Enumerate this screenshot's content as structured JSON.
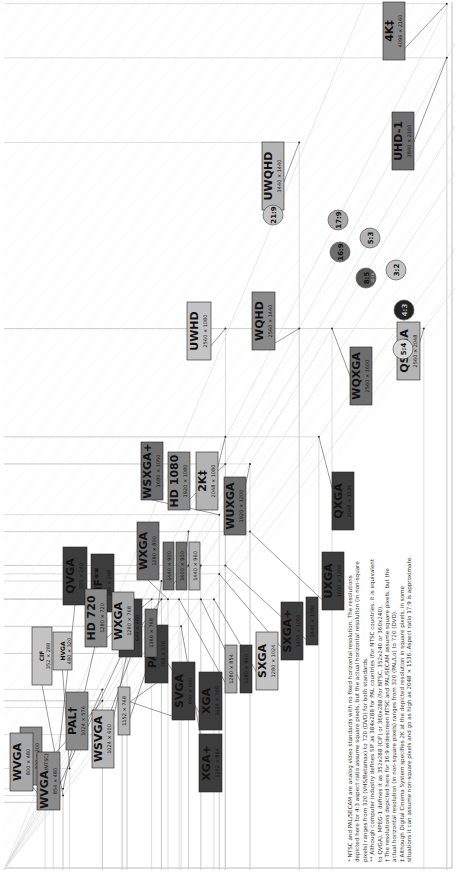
{
  "chart_data": {
    "type": "diagram",
    "axes": {
      "x": "width (px)",
      "y": "height (px)",
      "xmax": 4096,
      "ymax": 2160
    },
    "standards": [
      {
        "name": "CGA",
        "res": "320 × 200",
        "w": 320,
        "h": 200,
        "shade": "#8a8a8a",
        "lx": 20,
        "ly": 25,
        "lw": 22,
        "lh": 58
      },
      {
        "name": "CIF",
        "res": "352 × 288",
        "w": 352,
        "h": 288,
        "shade": "#c4c4c4",
        "lx": 32,
        "ly": 125,
        "lw": 20,
        "lh": 58,
        "small": true
      },
      {
        "name": "HVGA",
        "res": "480 × 320",
        "w": 480,
        "h": 320,
        "shade": "#bdbdbd",
        "lx": 53,
        "ly": 140,
        "lw": 19,
        "lh": 38,
        "small": true
      },
      {
        "name": "QVGA",
        "res": "320 × 240",
        "w": 320,
        "h": 240,
        "shade": "#3c3c3c",
        "lx": 63,
        "ly": 205,
        "lw": 24,
        "lh": 58
      },
      {
        "name": "SIF**",
        "res": "384 × 288",
        "w": 384,
        "h": 288,
        "shade": "#3c3c3c",
        "lx": 91,
        "ly": 198,
        "lw": 23,
        "lh": 58
      },
      {
        "name": "VGA",
        "res": "640 × 480",
        "w": 640,
        "h": 480,
        "shade": "#3c3c3c",
        "lx": 119,
        "ly": 153,
        "lw": 23,
        "lh": 58,
        "sub": "(NTSC)"
      },
      {
        "name": "PAL*",
        "res": "768 × 576",
        "w": 768,
        "h": 576,
        "shade": "#3c3c3c",
        "lx": 145,
        "ly": 127,
        "lw": 23,
        "lh": 58
      },
      {
        "name": "SVGA",
        "res": "800 × 600",
        "w": 800,
        "h": 600,
        "shade": "#3c3c3c",
        "lx": 172,
        "ly": 90,
        "lw": 23,
        "lh": 58
      },
      {
        "name": "XGA",
        "res": "1024 × 768",
        "w": 1024,
        "h": 768,
        "shade": "#3c3c3c",
        "lx": 199,
        "ly": 80,
        "lw": 23,
        "lh": 58
      },
      {
        "name": "XGA+",
        "res": "1152 × 864",
        "w": 1152,
        "h": 864,
        "shade": "#3c3c3c",
        "lx": 199,
        "ly": 18,
        "lw": 23,
        "lh": 58
      },
      {
        "name": "WVGA",
        "res": "800 × 480",
        "w": 800,
        "h": 480,
        "shade": "#a8a8a8",
        "lx": 10,
        "ly": 19,
        "lw": 23,
        "lh": 58
      },
      {
        "name": "WVGA",
        "res": "854 × 480",
        "w": 854,
        "h": 480,
        "shade": "#8a8a8a",
        "lx": 37,
        "ly": 0,
        "lw": 23,
        "lh": 58,
        "sub": "(NTSC)"
      },
      {
        "name": "PAL†",
        "res": "1024 × 576",
        "w": 1024,
        "h": 576,
        "shade": "#8a8a8a",
        "lx": 66,
        "ly": -60,
        "lw": 22,
        "lh": 58
      },
      {
        "name": "WSVGA",
        "res": "1024 × 600",
        "w": 1024,
        "h": 600,
        "shade": "#b4b4b4",
        "lx": 92,
        "ly": -42,
        "lw": 22,
        "lh": 58
      },
      {
        "name": "",
        "res": "1152 × 768",
        "w": 1152,
        "h": 768,
        "shade": "#b4b4b4",
        "lx": 118,
        "ly": -75,
        "lw": 12,
        "lh": 48,
        "small": true
      },
      {
        "name": "HD 720",
        "res": "1280 × 720",
        "w": 1280,
        "h": 720,
        "shade": "#8a8a8a",
        "lx": 85,
        "ly": -163,
        "lw": 22,
        "lh": 58
      },
      {
        "name": "WXGA",
        "res": "1280 × 768",
        "w": 1280,
        "h": 768,
        "shade": "#a8a8a8",
        "lx": 112,
        "ly": -160,
        "lw": 22,
        "lh": 58
      },
      {
        "name": "",
        "res": "1366 × 768",
        "w": 1366,
        "h": 768,
        "shade": "#6e6e6e",
        "lx": 145,
        "ly": -153,
        "lw": 12,
        "lh": 48,
        "small": true
      },
      {
        "name": "WXGA",
        "res": "1280 × 800",
        "w": 1280,
        "h": 800,
        "shade": "#6e6e6e",
        "lx": 137,
        "ly": -230,
        "lw": 22,
        "lh": 58
      },
      {
        "name": "",
        "res": "1440 × 900",
        "w": 1440,
        "h": 900,
        "shade": "#6e6e6e",
        "lx": 163,
        "ly": -220,
        "lw": 11,
        "lh": 48,
        "small": true
      },
      {
        "name": "",
        "res": "1600 × 900",
        "w": 1600,
        "h": 900,
        "shade": "#6e6e6e",
        "lx": 176,
        "ly": -220,
        "lw": 11,
        "lh": 48,
        "small": true
      },
      {
        "name": "",
        "res": "1440 × 960",
        "w": 1440,
        "h": 960,
        "shade": "#b4b4b4",
        "lx": 189,
        "ly": -220,
        "lw": 11,
        "lh": 48,
        "small": true
      },
      {
        "name": "WSXGA+",
        "res": "1680 × 1050",
        "w": 1680,
        "h": 1050,
        "shade": "#6e6e6e",
        "lx": 141,
        "ly": -310,
        "lw": 22,
        "lh": 58
      },
      {
        "name": "HD 1080",
        "res": "1920 × 1080",
        "w": 1920,
        "h": 1080,
        "shade": "#8a8a8a",
        "lx": 168,
        "ly": -300,
        "lw": 22,
        "lh": 58
      },
      {
        "name": "2K‡",
        "res": "2048 × 1080",
        "w": 2048,
        "h": 1080,
        "shade": "#b4b4b4",
        "lx": 196,
        "ly": -300,
        "lw": 22,
        "lh": 58
      },
      {
        "name": "WUXGA",
        "res": "1920 × 1200",
        "w": 1920,
        "h": 1200,
        "shade": "#6e6e6e",
        "lx": 224,
        "ly": -275,
        "lw": 22,
        "lh": 58
      },
      {
        "name": "",
        "res": "1280 × 854",
        "w": 1280,
        "h": 854,
        "shade": "#a8a8a8",
        "lx": 225,
        "ly": -117,
        "lw": 12,
        "lh": 48,
        "small": true
      },
      {
        "name": "",
        "res": "1280 × 960",
        "w": 1280,
        "h": 960,
        "shade": "#3c3c3c",
        "lx": 240,
        "ly": -117,
        "lw": 12,
        "lh": 48,
        "small": true
      },
      {
        "name": "SXGA",
        "res": "1280 × 1024",
        "w": 1280,
        "h": 1024,
        "shade": "#c4c4c4",
        "lx": 256,
        "ly": -120,
        "lw": 22,
        "lh": 58
      },
      {
        "name": "SXGA+",
        "res": "1400 × 1050",
        "w": 1400,
        "h": 1050,
        "shade": "#3c3c3c",
        "lx": 281,
        "ly": -150,
        "lw": 22,
        "lh": 58
      },
      {
        "name": "",
        "res": "1440 × 1080",
        "w": 1440,
        "h": 1080,
        "shade": "#3c3c3c",
        "lx": 306,
        "ly": -165,
        "lw": 12,
        "lh": 48,
        "small": true
      },
      {
        "name": "UXGA",
        "res": "1600 × 1200",
        "w": 1600,
        "h": 1200,
        "shade": "#3c3c3c",
        "lx": 322,
        "ly": -200,
        "lw": 22,
        "lh": 58
      },
      {
        "name": "QXGA",
        "res": "2048 × 1536",
        "w": 2048,
        "h": 1536,
        "shade": "#3c3c3c",
        "lx": 332,
        "ly": -280,
        "lw": 22,
        "lh": 58
      },
      {
        "name": "WQXGA",
        "res": "2560 × 1600",
        "w": 2560,
        "h": 1600,
        "shade": "#6e6e6e",
        "lx": 350,
        "ly": -405,
        "lw": 22,
        "lh": 58
      },
      {
        "name": "QSXGA",
        "res": "2560 × 2048",
        "w": 2560,
        "h": 2048,
        "shade": "#b4b4b4",
        "lx": 397,
        "ly": -430,
        "lw": 23,
        "lh": 58
      },
      {
        "name": "UWHD",
        "res": "2560 × 1080",
        "w": 2560,
        "h": 1080,
        "shade": "#c4c4c4",
        "lx": 187,
        "ly": -450,
        "lw": 24,
        "lh": 58
      },
      {
        "name": "WQHD",
        "res": "2560 × 1440",
        "w": 2560,
        "h": 1440,
        "shade": "#8a8a8a",
        "lx": 252,
        "ly": -460,
        "lw": 23,
        "lh": 58
      },
      {
        "name": "UWQHD",
        "res": "3440 × 1440",
        "w": 3440,
        "h": 1440,
        "shade": "#b4b4b4",
        "lx": 262,
        "ly": -600,
        "lw": 22,
        "lh": 68
      },
      {
        "name": "UHD-1",
        "res": "3840 × 2160",
        "w": 3840,
        "h": 2160,
        "shade": "#6e6e6e",
        "lx": 392,
        "ly": -640,
        "lw": 22,
        "lh": 58
      },
      {
        "name": "4K‡",
        "res": "4096 × 2160",
        "w": 4096,
        "h": 2160,
        "shade": "#8a8a8a",
        "lx": 383,
        "ly": -795,
        "lw": 22,
        "lh": 58
      }
    ],
    "aspect_ratios": [
      {
        "label": "21:9",
        "cx": 273,
        "cy": 215,
        "fill": "#c4c4c4"
      },
      {
        "label": "17:9",
        "cx": 338,
        "cy": 220,
        "fill": "#a8a8a8"
      },
      {
        "label": "16:9",
        "cx": 340,
        "cy": 252,
        "fill": "#6e6e6e"
      },
      {
        "label": "5:3",
        "cx": 370,
        "cy": 238,
        "fill": "#b4b4b4"
      },
      {
        "label": "8:5",
        "cx": 366,
        "cy": 278,
        "fill": "#555555",
        "sub": "16:10"
      },
      {
        "label": "3:2",
        "cx": 396,
        "cy": 270,
        "fill": "#c4c4c4"
      },
      {
        "label": "4:3",
        "cx": 404,
        "cy": 310,
        "fill": "#222222",
        "light": true
      },
      {
        "label": "5:4",
        "cx": 403,
        "cy": 349,
        "fill": "#d8d8d8"
      }
    ]
  },
  "footnotes": [
    "*  NTSC and PAL/SECAM are analog video standards with no fixed horizontal resolution. The resolutions",
    "    depicted here for 4:3 aspect ratio assume square pixels, but the actual horizontal resolution (in non-square",
    "    pixels) ranges from 320 (VHS/Betamax) to 720 (DVD) for both standards.",
    "** Although computer industry defines SIF as 384x288 for PAL countries (for NTSC countries, it is equivalent",
    "    to QVGA), MPEG-1 defines it as 352x288 (CIF) or 360x288 (for NTSC, 352x240 or 360x240).",
    "†  The resolutions depicted here for 16:9 widescreen NTSC and PAL/SECAM assume square pixels, but the",
    "    actual horizontal resolution (in non-square pixels) ranges from 320 (PAL/Lo) to 720 (DVD).",
    "‡  Although Digital Cinema System specifies 2K at the depicted resolution in square pixels, in some",
    "    situations it can assume non-square pixels and go as high as 2048 × 1536. Aspect ratio 17:9 is approximate."
  ]
}
